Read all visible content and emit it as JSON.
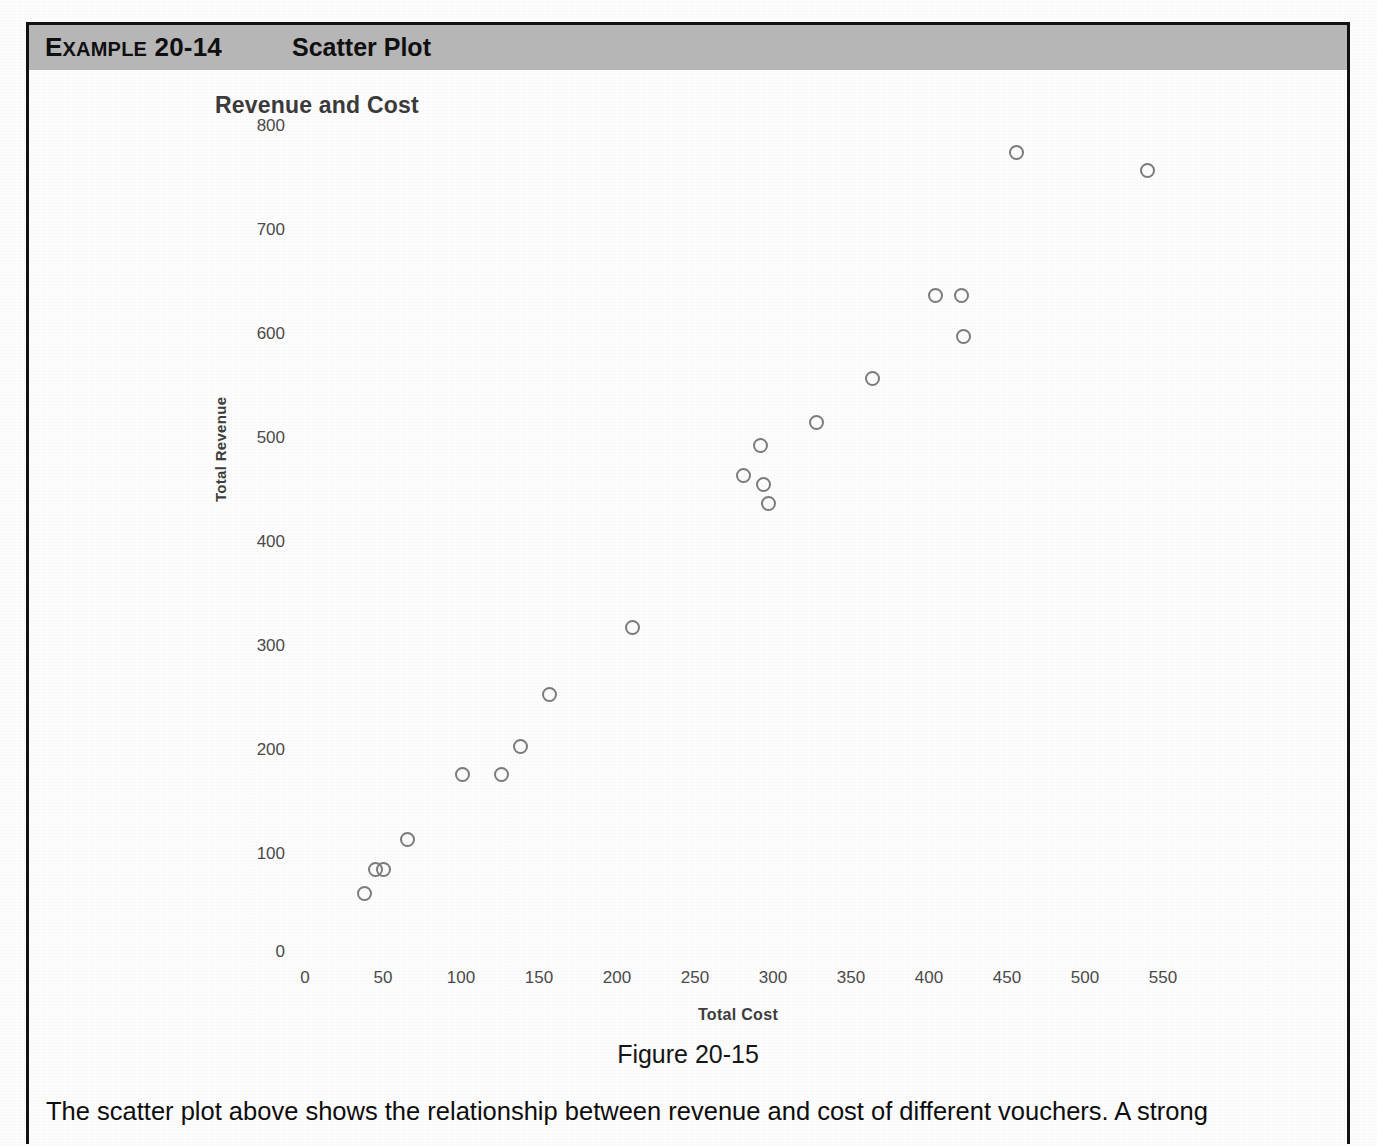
{
  "header": {
    "example_prefix": "E",
    "example_label_rest": "XAMPLE",
    "example_number": "20-14",
    "title": "Scatter Plot"
  },
  "figure": {
    "caption": "Figure 20-15"
  },
  "body": {
    "paragraph_line1": "The scatter plot above shows the relationship between revenue and cost of different vouchers. A strong",
    "paragraph_line2": "positive correlation would be suggested because the charted pattern resembles a straight"
  },
  "chart_data": {
    "type": "scatter",
    "title": "Revenue and Cost",
    "xlabel": "Total Cost",
    "ylabel": "Total Revenue",
    "xlim": [
      0,
      575
    ],
    "ylim": [
      0,
      800
    ],
    "grid": false,
    "legend": null,
    "x_ticks": [
      0,
      50,
      100,
      150,
      200,
      250,
      300,
      350,
      400,
      450,
      500,
      550
    ],
    "y_ticks": [
      0,
      100,
      200,
      300,
      400,
      500,
      600,
      700,
      800
    ],
    "origin_label": "0",
    "marker": "open-circle",
    "marker_color": "#7b7b7b",
    "points": [
      {
        "x": 38,
        "y": 62
      },
      {
        "x": 45,
        "y": 85
      },
      {
        "x": 50,
        "y": 85
      },
      {
        "x": 66,
        "y": 114
      },
      {
        "x": 101,
        "y": 176
      },
      {
        "x": 126,
        "y": 176
      },
      {
        "x": 138,
        "y": 203
      },
      {
        "x": 157,
        "y": 253
      },
      {
        "x": 210,
        "y": 318
      },
      {
        "x": 281,
        "y": 464
      },
      {
        "x": 292,
        "y": 493
      },
      {
        "x": 294,
        "y": 455
      },
      {
        "x": 297,
        "y": 437
      },
      {
        "x": 328,
        "y": 515
      },
      {
        "x": 364,
        "y": 557
      },
      {
        "x": 404,
        "y": 637
      },
      {
        "x": 421,
        "y": 637
      },
      {
        "x": 422,
        "y": 598
      },
      {
        "x": 456,
        "y": 775
      },
      {
        "x": 540,
        "y": 757
      }
    ]
  }
}
